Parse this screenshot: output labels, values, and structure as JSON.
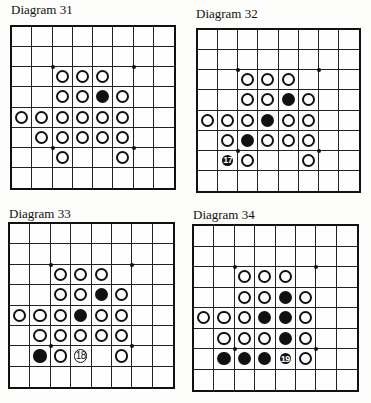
{
  "diagrams": [
    {
      "title": "Diagram 31",
      "title_pos": [
        11,
        3
      ],
      "board_rect": [
        10,
        25,
        166,
        165
      ],
      "pieces": [
        {
          "r": 2,
          "c": 2,
          "color": "W"
        },
        {
          "r": 2,
          "c": 3,
          "color": "W"
        },
        {
          "r": 2,
          "c": 4,
          "color": "W"
        },
        {
          "r": 3,
          "c": 2,
          "color": "W"
        },
        {
          "r": 3,
          "c": 3,
          "color": "W"
        },
        {
          "r": 3,
          "c": 4,
          "color": "B"
        },
        {
          "r": 3,
          "c": 5,
          "color": "W"
        },
        {
          "r": 4,
          "c": 0,
          "color": "W"
        },
        {
          "r": 4,
          "c": 1,
          "color": "W"
        },
        {
          "r": 4,
          "c": 2,
          "color": "W"
        },
        {
          "r": 4,
          "c": 3,
          "color": "W"
        },
        {
          "r": 4,
          "c": 4,
          "color": "W"
        },
        {
          "r": 4,
          "c": 5,
          "color": "W"
        },
        {
          "r": 5,
          "c": 1,
          "color": "W"
        },
        {
          "r": 5,
          "c": 2,
          "color": "W"
        },
        {
          "r": 5,
          "c": 3,
          "color": "W"
        },
        {
          "r": 5,
          "c": 4,
          "color": "W"
        },
        {
          "r": 5,
          "c": 5,
          "color": "W"
        },
        {
          "r": 6,
          "c": 2,
          "color": "W"
        },
        {
          "r": 6,
          "c": 5,
          "color": "W"
        }
      ]
    },
    {
      "title": "Diagram 32",
      "title_pos": [
        196,
        7
      ],
      "board_rect": [
        196,
        28,
        165,
        165
      ],
      "pieces": [
        {
          "r": 2,
          "c": 2,
          "color": "W"
        },
        {
          "r": 2,
          "c": 3,
          "color": "W"
        },
        {
          "r": 2,
          "c": 4,
          "color": "W"
        },
        {
          "r": 3,
          "c": 2,
          "color": "W"
        },
        {
          "r": 3,
          "c": 3,
          "color": "W"
        },
        {
          "r": 3,
          "c": 4,
          "color": "B"
        },
        {
          "r": 3,
          "c": 5,
          "color": "W"
        },
        {
          "r": 4,
          "c": 0,
          "color": "W"
        },
        {
          "r": 4,
          "c": 1,
          "color": "W"
        },
        {
          "r": 4,
          "c": 2,
          "color": "W"
        },
        {
          "r": 4,
          "c": 3,
          "color": "B"
        },
        {
          "r": 4,
          "c": 4,
          "color": "W"
        },
        {
          "r": 4,
          "c": 5,
          "color": "W"
        },
        {
          "r": 5,
          "c": 1,
          "color": "W"
        },
        {
          "r": 5,
          "c": 2,
          "color": "B"
        },
        {
          "r": 5,
          "c": 3,
          "color": "W"
        },
        {
          "r": 5,
          "c": 4,
          "color": "W"
        },
        {
          "r": 5,
          "c": 5,
          "color": "W"
        },
        {
          "r": 6,
          "c": 1,
          "color": "B",
          "label": "17"
        },
        {
          "r": 6,
          "c": 2,
          "color": "W"
        },
        {
          "r": 6,
          "c": 5,
          "color": "W"
        }
      ]
    },
    {
      "title": "Diagram 33",
      "title_pos": [
        9,
        207
      ],
      "board_rect": [
        8,
        222,
        167,
        167
      ],
      "pieces": [
        {
          "r": 2,
          "c": 2,
          "color": "W"
        },
        {
          "r": 2,
          "c": 3,
          "color": "W"
        },
        {
          "r": 2,
          "c": 4,
          "color": "W"
        },
        {
          "r": 3,
          "c": 2,
          "color": "W"
        },
        {
          "r": 3,
          "c": 3,
          "color": "W"
        },
        {
          "r": 3,
          "c": 4,
          "color": "B"
        },
        {
          "r": 3,
          "c": 5,
          "color": "W"
        },
        {
          "r": 4,
          "c": 0,
          "color": "W"
        },
        {
          "r": 4,
          "c": 1,
          "color": "W"
        },
        {
          "r": 4,
          "c": 2,
          "color": "W"
        },
        {
          "r": 4,
          "c": 3,
          "color": "B"
        },
        {
          "r": 4,
          "c": 4,
          "color": "W"
        },
        {
          "r": 4,
          "c": 5,
          "color": "W"
        },
        {
          "r": 5,
          "c": 1,
          "color": "W"
        },
        {
          "r": 5,
          "c": 2,
          "color": "W"
        },
        {
          "r": 5,
          "c": 3,
          "color": "W"
        },
        {
          "r": 5,
          "c": 4,
          "color": "W"
        },
        {
          "r": 5,
          "c": 5,
          "color": "W"
        },
        {
          "r": 6,
          "c": 1,
          "color": "B"
        },
        {
          "r": 6,
          "c": 2,
          "color": "W"
        },
        {
          "r": 6,
          "c": 3,
          "color": "W",
          "label": "18"
        },
        {
          "r": 6,
          "c": 5,
          "color": "W"
        }
      ]
    },
    {
      "title": "Diagram 34",
      "title_pos": [
        193,
        208
      ],
      "board_rect": [
        192,
        224,
        167,
        168
      ],
      "pieces": [
        {
          "r": 2,
          "c": 2,
          "color": "W"
        },
        {
          "r": 2,
          "c": 3,
          "color": "W"
        },
        {
          "r": 2,
          "c": 4,
          "color": "W"
        },
        {
          "r": 3,
          "c": 2,
          "color": "W"
        },
        {
          "r": 3,
          "c": 3,
          "color": "W"
        },
        {
          "r": 3,
          "c": 4,
          "color": "B"
        },
        {
          "r": 3,
          "c": 5,
          "color": "W"
        },
        {
          "r": 4,
          "c": 0,
          "color": "W"
        },
        {
          "r": 4,
          "c": 1,
          "color": "W"
        },
        {
          "r": 4,
          "c": 2,
          "color": "W"
        },
        {
          "r": 4,
          "c": 3,
          "color": "B"
        },
        {
          "r": 4,
          "c": 4,
          "color": "B"
        },
        {
          "r": 4,
          "c": 5,
          "color": "W"
        },
        {
          "r": 5,
          "c": 1,
          "color": "W"
        },
        {
          "r": 5,
          "c": 2,
          "color": "W"
        },
        {
          "r": 5,
          "c": 3,
          "color": "W"
        },
        {
          "r": 5,
          "c": 4,
          "color": "B"
        },
        {
          "r": 5,
          "c": 5,
          "color": "W"
        },
        {
          "r": 6,
          "c": 1,
          "color": "B"
        },
        {
          "r": 6,
          "c": 2,
          "color": "B"
        },
        {
          "r": 6,
          "c": 3,
          "color": "B"
        },
        {
          "r": 6,
          "c": 4,
          "color": "B",
          "label": "19"
        },
        {
          "r": 6,
          "c": 5,
          "color": "W"
        }
      ]
    }
  ],
  "board": {
    "size": 8,
    "star_points": [
      [
        2,
        2
      ],
      [
        2,
        6
      ],
      [
        6,
        2
      ],
      [
        6,
        6
      ]
    ]
  }
}
